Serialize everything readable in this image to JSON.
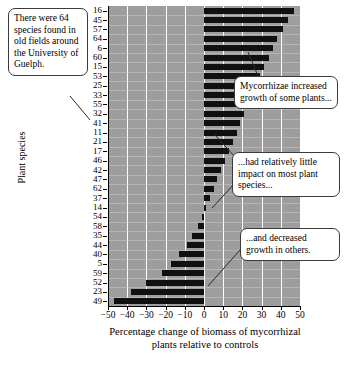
{
  "figure": {
    "axis_titles": {
      "y": "Plant species",
      "x_line1": "Percentage change of biomass of mycorrhizal",
      "x_line2": "plants relative to controls"
    }
  },
  "callouts": [
    {
      "id": "species-count",
      "text": "There were 64 species found in old fields around the University of Guelph."
    },
    {
      "id": "increased-growth",
      "text": "Mycorrhizae increased growth of some plants..."
    },
    {
      "id": "little-impact",
      "text": "...had relatively little impact on most plant species..."
    },
    {
      "id": "decreased-growth",
      "text": "...and decreased growth in others."
    }
  ],
  "chart_data": {
    "type": "bar",
    "orientation": "horizontal",
    "title": "",
    "xlabel": "Percentage change of biomass of mycorrhizal plants relative to controls",
    "ylabel": "Plant species",
    "xlim": [
      -50,
      50
    ],
    "xticks": [
      -50,
      -40,
      -30,
      -20,
      -10,
      0,
      10,
      20,
      30,
      40,
      50
    ],
    "xticklabels": [
      "−50",
      "−40",
      "−30",
      "−20",
      "−10",
      "0",
      "10",
      "20",
      "30",
      "40",
      "50"
    ],
    "grid": true,
    "legend": "none",
    "plot_background": "#9d9d9d",
    "bar_color": "#101010",
    "categories": [
      "16",
      "45",
      "57",
      "64",
      "6",
      "60",
      "15",
      "53",
      "25",
      "33",
      "55",
      "32",
      "41",
      "11",
      "21",
      "17",
      "46",
      "42",
      "47",
      "62",
      "37",
      "14",
      "54",
      "58",
      "35",
      "44",
      "40",
      "5",
      "59",
      "52",
      "23",
      "49"
    ],
    "values": [
      47,
      44,
      41,
      38,
      36,
      34,
      31,
      29,
      27,
      25,
      23,
      21,
      19,
      17,
      15,
      13,
      11,
      9,
      7,
      5,
      3,
      1,
      -1,
      -3,
      -6,
      -9,
      -13,
      -17,
      -22,
      -30,
      -38,
      -47
    ]
  }
}
